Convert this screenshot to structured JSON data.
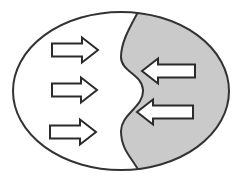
{
  "figure": {
    "canvas": {
      "width": 239,
      "height": 185,
      "background": "#ffffff"
    },
    "colors": {
      "outline": "#333333",
      "arrow_outline": "#2b2b2b",
      "left_region_fill": "#ffffff",
      "right_region_fill": "#cacaca",
      "arrow_fill": "#ffffff"
    },
    "ellipse": {
      "cx": 121,
      "cy": 91,
      "rx": 108,
      "ry": 79,
      "stroke_width": 2
    },
    "wavy_boundary": {
      "path": "M 138,12 C 130,27 121,42 121,57 C 121,72 142,74 143,90 C 144,107 121,114 121,131 C 121,149 131,157 139,171",
      "stroke_width": 2
    },
    "shaded_region_close": "L 239,185 L 239,0 Z",
    "arrows": [
      {
        "name": "left-arrow-top",
        "direction": "right",
        "tail_x": 52,
        "tip_x": 98,
        "center_y": 50,
        "shaft_half_height": 6.5,
        "head_half_height": 12.5,
        "head_length": 16,
        "stroke_width": 2
      },
      {
        "name": "left-arrow-middle",
        "direction": "right",
        "tail_x": 52,
        "tip_x": 97,
        "center_y": 90,
        "shaft_half_height": 6.5,
        "head_half_height": 12.5,
        "head_length": 16,
        "stroke_width": 2
      },
      {
        "name": "left-arrow-bottom",
        "direction": "right",
        "tail_x": 50,
        "tip_x": 96,
        "center_y": 132,
        "shaft_half_height": 6.5,
        "head_half_height": 12.5,
        "head_length": 16,
        "stroke_width": 2
      },
      {
        "name": "right-arrow-top",
        "direction": "left",
        "tail_x": 195,
        "tip_x": 142,
        "center_y": 71,
        "shaft_half_height": 6.5,
        "head_half_height": 12.5,
        "head_length": 16,
        "stroke_width": 2
      },
      {
        "name": "right-arrow-bottom",
        "direction": "left",
        "tail_x": 193,
        "tip_x": 137,
        "center_y": 112,
        "shaft_half_height": 6.5,
        "head_half_height": 12.5,
        "head_length": 16,
        "stroke_width": 2
      }
    ]
  }
}
